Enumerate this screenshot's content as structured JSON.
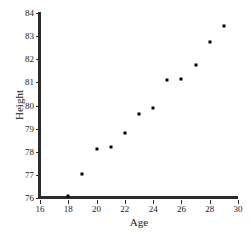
{
  "chart_data": {
    "type": "scatter",
    "title": "",
    "xlabel": "Age",
    "ylabel": "Height",
    "xlim": [
      16,
      30
    ],
    "ylim": [
      76,
      84
    ],
    "xticks": [
      16,
      18,
      20,
      22,
      24,
      26,
      28,
      30
    ],
    "yticks": [
      76,
      77,
      78,
      79,
      80,
      81,
      82,
      83,
      84
    ],
    "grid": false,
    "legend": null,
    "marker": "square",
    "marker_color": "#000000",
    "axis_color": "#2b2b2b",
    "points": [
      {
        "x": 18,
        "y": 76.1
      },
      {
        "x": 19,
        "y": 77.05
      },
      {
        "x": 20,
        "y": 78.1
      },
      {
        "x": 21,
        "y": 78.2
      },
      {
        "x": 22,
        "y": 78.8
      },
      {
        "x": 23,
        "y": 79.65
      },
      {
        "x": 24,
        "y": 79.9
      },
      {
        "x": 25,
        "y": 81.1
      },
      {
        "x": 26,
        "y": 81.15
      },
      {
        "x": 27,
        "y": 81.75
      },
      {
        "x": 28,
        "y": 82.75
      },
      {
        "x": 29,
        "y": 83.45
      }
    ]
  }
}
